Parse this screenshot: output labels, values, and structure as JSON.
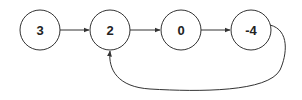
{
  "diagram": {
    "type": "linked-list-with-cycle",
    "colors": {
      "stroke": "#333333",
      "background": "#ffffff",
      "text": "#222222"
    },
    "nodes": [
      {
        "id": "n0",
        "label": "3",
        "cx": 40,
        "cy": 30,
        "r": 20
      },
      {
        "id": "n1",
        "label": "2",
        "cx": 110,
        "cy": 30,
        "r": 20
      },
      {
        "id": "n2",
        "label": "0",
        "cx": 181,
        "cy": 30,
        "r": 20
      },
      {
        "id": "n3",
        "label": "-4",
        "cx": 251,
        "cy": 30,
        "r": 20
      }
    ],
    "edges": [
      {
        "from": "3",
        "to": "2"
      },
      {
        "from": "2",
        "to": "0"
      },
      {
        "from": "0",
        "to": "-4"
      },
      {
        "from": "-4",
        "to": "2",
        "kind": "cycle-back"
      }
    ]
  }
}
